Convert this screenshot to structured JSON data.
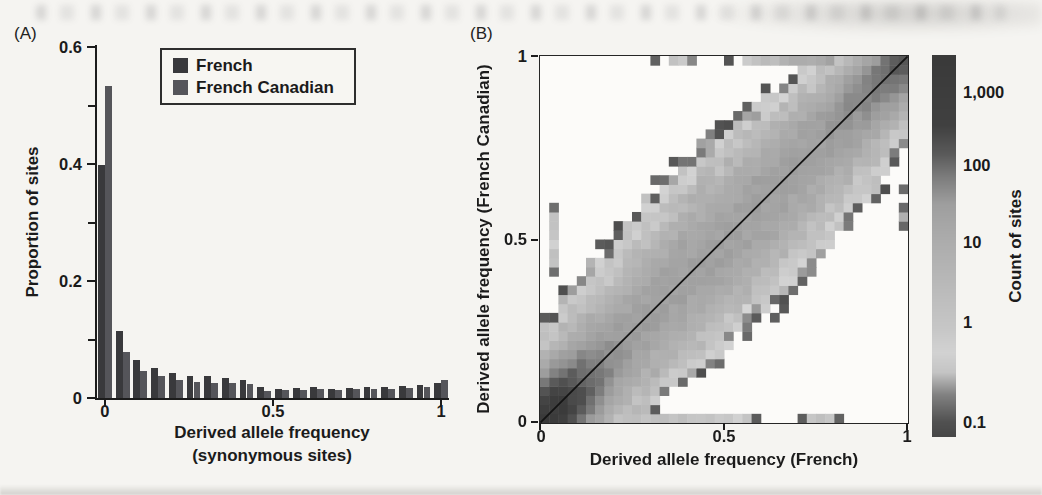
{
  "figure": {
    "background": "#f5f4f1",
    "panel_a": {
      "label": "(A)",
      "ylabel": "Proportion of sites",
      "xlabel_line1": "Derived allele frequency",
      "xlabel_line2": "(synonymous sites)",
      "yticks": [
        "0.6",
        "0.4",
        "0.2",
        "0"
      ],
      "xticks": [
        "0",
        "0.5",
        "1"
      ],
      "legend": {
        "items": [
          {
            "label": "French"
          },
          {
            "label": "French Canadian"
          }
        ]
      }
    },
    "panel_b": {
      "label": "(B)",
      "ylabel": "Derived allele frequency (French Canadian)",
      "xlabel": "Derived allele frequency (French)",
      "yticks": [
        "1",
        "0.5",
        "0"
      ],
      "xticks": [
        "0",
        "0.5",
        "1"
      ],
      "colorbar": {
        "label": "Count of sites",
        "ticks": [
          "1,000",
          "100",
          "10",
          "1",
          "0.1"
        ]
      }
    }
  },
  "chart_data": [
    {
      "type": "bar",
      "panel": "A",
      "title": "Derived allele frequency spectrum (synonymous sites)",
      "xlabel": "Derived allele frequency (synonymous sites)",
      "ylabel": "Proportion of sites",
      "xlim": [
        0,
        1
      ],
      "ylim": [
        0,
        0.6
      ],
      "bins": 20,
      "yticks": [
        0,
        0.2,
        0.4,
        0.6
      ],
      "yticks_minor": [
        0.1,
        0.3,
        0.5
      ],
      "xticks": [
        0,
        0.5,
        1
      ],
      "legend_position": "upper-left-inside",
      "series": [
        {
          "name": "French",
          "color": "#39393c",
          "values": [
            0.398,
            0.114,
            0.065,
            0.051,
            0.043,
            0.038,
            0.037,
            0.035,
            0.031,
            0.018,
            0.016,
            0.017,
            0.018,
            0.016,
            0.017,
            0.018,
            0.019,
            0.02,
            0.022,
            0.026
          ]
        },
        {
          "name": "French Canadian",
          "color": "#55555a",
          "values": [
            0.533,
            0.079,
            0.047,
            0.037,
            0.03,
            0.027,
            0.026,
            0.026,
            0.024,
            0.012,
            0.014,
            0.014,
            0.015,
            0.014,
            0.015,
            0.015,
            0.016,
            0.017,
            0.019,
            0.03
          ]
        }
      ]
    },
    {
      "type": "heatmap",
      "panel": "B",
      "xlabel": "Derived allele frequency (French)",
      "ylabel": "Derived allele frequency (French Canadian)",
      "xlim": [
        0,
        1
      ],
      "ylim": [
        0,
        1
      ],
      "bins": 40,
      "xticks": [
        0,
        0.5,
        1
      ],
      "yticks": [
        0,
        0.5,
        1
      ],
      "diagonal_line": true,
      "colorbar": {
        "label": "Count of sites",
        "scale": "log",
        "ticks": [
          1000,
          100,
          10,
          1,
          0.1
        ],
        "range": [
          0.065,
          3300
        ]
      },
      "density_model": {
        "description": "count(x,y)=M(f)*exp(-d^2/(2*s(f)^2)); f=(x+y)/2; d=|x-y|; M(f)=base+rare_peak*exp(-f/rare_scale)+fixed_peak*f^fixed_power; s(f)=sigma0+sigma1*f*(1-f); jagged edge noise exp(amp*(hash-0.5)); cell drawn when count>=threshold",
        "base": 25,
        "rare_peak": 1500,
        "rare_scale": 0.045,
        "fixed_peak": 150,
        "fixed_power": 12,
        "sigma0": 0.045,
        "sigma1": 0.22,
        "noise_low": 1.9,
        "noise_high": 0.4,
        "threshold": 0.095
      },
      "extra_cells": [
        [
          6,
          0,
          2.2
        ],
        [
          7,
          0,
          0.25
        ],
        [
          8,
          0,
          1.8
        ],
        [
          9,
          0,
          1.5
        ],
        [
          10,
          0,
          1.8
        ],
        [
          11,
          0,
          1.2
        ],
        [
          12,
          0,
          1.5
        ],
        [
          13,
          0,
          1.0
        ],
        [
          14,
          0,
          1.3
        ],
        [
          15,
          0,
          1.6
        ],
        [
          16,
          0,
          1.1
        ],
        [
          17,
          0,
          0.9
        ],
        [
          18,
          0,
          1.2
        ],
        [
          19,
          0,
          0.8
        ],
        [
          20,
          0,
          1.0
        ],
        [
          21,
          0,
          0.6
        ],
        [
          22,
          0,
          0.3
        ],
        [
          23,
          0,
          0.12
        ],
        [
          28,
          0,
          0.15
        ],
        [
          29,
          0,
          1.0
        ],
        [
          30,
          0,
          1.6
        ],
        [
          31,
          0,
          0.9
        ],
        [
          32,
          0,
          0.14
        ],
        [
          12,
          39,
          0.16
        ],
        [
          14,
          39,
          1.3
        ],
        [
          15,
          39,
          1.0
        ],
        [
          16,
          39,
          0.18
        ],
        [
          20,
          39,
          0.15
        ],
        [
          22,
          39,
          0.4
        ],
        [
          23,
          39,
          1.2
        ],
        [
          24,
          39,
          2.0
        ],
        [
          25,
          39,
          3.0
        ],
        [
          26,
          39,
          4.5
        ],
        [
          27,
          39,
          6
        ],
        [
          28,
          39,
          8
        ],
        [
          29,
          39,
          10
        ],
        [
          30,
          39,
          13
        ],
        [
          31,
          39,
          16
        ],
        [
          1,
          16,
          0.16
        ],
        [
          1,
          17,
          0.9
        ],
        [
          1,
          18,
          1.3
        ],
        [
          1,
          19,
          0.6
        ],
        [
          1,
          20,
          1.1
        ],
        [
          1,
          21,
          0.9
        ],
        [
          1,
          22,
          0.25
        ],
        [
          1,
          23,
          0.16
        ],
        [
          39,
          21,
          0.15
        ],
        [
          39,
          22,
          0.2
        ],
        [
          39,
          23,
          0.15
        ],
        [
          39,
          25,
          0.13
        ],
        [
          39,
          31,
          0.16
        ],
        [
          39,
          32,
          0.2
        ],
        [
          39,
          33,
          0.16
        ]
      ],
      "colormap_gray_breakpoints": [
        [
          -1.2,
          70
        ],
        [
          -1.0,
          80
        ],
        [
          -0.72,
          130
        ],
        [
          -0.5,
          196
        ],
        [
          -0.3,
          210
        ],
        [
          -0.05,
          198
        ],
        [
          0.6,
          182
        ],
        [
          1.1,
          170
        ],
        [
          1.5,
          158
        ],
        [
          1.85,
          124
        ],
        [
          2.15,
          90
        ],
        [
          2.55,
          64
        ],
        [
          3.6,
          57
        ]
      ],
      "colorbar_anchor_points": [
        [
          0,
          3.52
        ],
        [
          0.097,
          3
        ],
        [
          0.288,
          2
        ],
        [
          0.49,
          1
        ],
        [
          0.7,
          0
        ],
        [
          0.96,
          -1
        ],
        [
          1,
          -1.2
        ]
      ]
    }
  ]
}
